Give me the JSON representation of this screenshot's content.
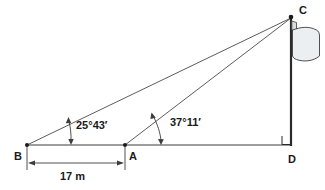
{
  "figure": {
    "type": "geometry-diagram",
    "background_color": "#ffffff",
    "line_color": "#3c3c3c",
    "flag_fill_color": "#eceff1",
    "pole_color": "#2b2b2b"
  },
  "vertices": {
    "B": {
      "label": "B",
      "x": 27,
      "y": 145
    },
    "A": {
      "label": "A",
      "x": 125,
      "y": 145
    },
    "C": {
      "label": "C",
      "x": 291,
      "y": 18
    },
    "D": {
      "label": "D",
      "x": 291,
      "y": 145
    }
  },
  "angles": [
    {
      "at": "B",
      "label": "25°43′",
      "degrees": 25,
      "minutes": 43,
      "marker": "double-headed-arc-arrow"
    },
    {
      "at": "A",
      "label": "37°11′",
      "degrees": 37,
      "minutes": 11,
      "marker": "double-headed-arc-arrow"
    }
  ],
  "right_angle": {
    "at": "D",
    "label": "",
    "marker": "square"
  },
  "dimension": {
    "label": "17 m",
    "value": 17,
    "unit": "m",
    "from": "B",
    "to": "A",
    "style": "double-headed-arrow"
  },
  "segments": [
    {
      "name": "ground-line",
      "from": "B",
      "to": "D"
    },
    {
      "name": "sight-line-b-c",
      "from": "B",
      "to": "C"
    },
    {
      "name": "sight-line-a-c",
      "from": "A",
      "to": "C"
    },
    {
      "name": "flagpole",
      "from": "C",
      "to": "D"
    }
  ],
  "flag": {
    "name": "flag",
    "attached_to": "flagpole",
    "direction": "right",
    "fill": "#eceff1"
  }
}
